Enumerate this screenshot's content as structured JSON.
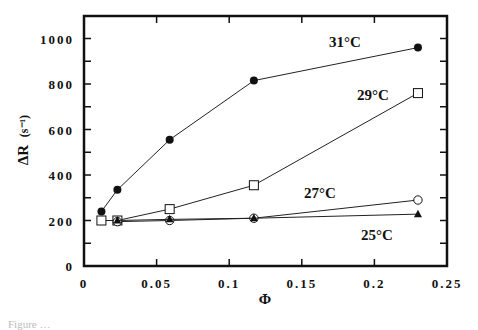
{
  "chart_data": {
    "type": "line",
    "title": "",
    "xlabel": "Φ",
    "ylabel": "ΔR (s⁻¹)",
    "ylabel_main": "ΔR",
    "ylabel_unit": "(s⁻¹)",
    "xlim": [
      0,
      0.25
    ],
    "ylim": [
      0,
      1100
    ],
    "x_ticks": [
      0,
      0.05,
      0.1,
      0.15,
      0.2,
      0.25
    ],
    "x_tick_labels": [
      "0",
      "0.05",
      "0.1",
      "0.15",
      "0.2",
      "0.25"
    ],
    "y_ticks": [
      0,
      200,
      400,
      600,
      800,
      1000
    ],
    "y_tick_labels": [
      "0",
      "200",
      "400",
      "600",
      "800",
      "1000"
    ],
    "grid": false,
    "legend": "inline labels next to series",
    "series": [
      {
        "name": "31°C",
        "marker": "filled-circle",
        "x": [
          0.012,
          0.023,
          0.059,
          0.117,
          0.23
        ],
        "values": [
          240,
          335,
          555,
          815,
          960
        ],
        "label_pos": [
          329,
          47
        ]
      },
      {
        "name": "29°C",
        "marker": "open-square",
        "x": [
          0.012,
          0.023,
          0.059,
          0.117,
          0.23
        ],
        "values": [
          200,
          200,
          250,
          355,
          760
        ],
        "label_pos": [
          357,
          100
        ]
      },
      {
        "name": "27°C",
        "marker": "open-circle",
        "x": [
          0.023,
          0.059,
          0.117,
          0.23
        ],
        "values": [
          195,
          200,
          210,
          290
        ],
        "label_pos": [
          304,
          198
        ]
      },
      {
        "name": "25°C",
        "marker": "filled-triangle",
        "x": [
          0.023,
          0.059,
          0.117,
          0.23
        ],
        "values": [
          200,
          205,
          210,
          228
        ],
        "label_pos": [
          361,
          240
        ]
      }
    ]
  },
  "caption_fragment": "Figure …"
}
